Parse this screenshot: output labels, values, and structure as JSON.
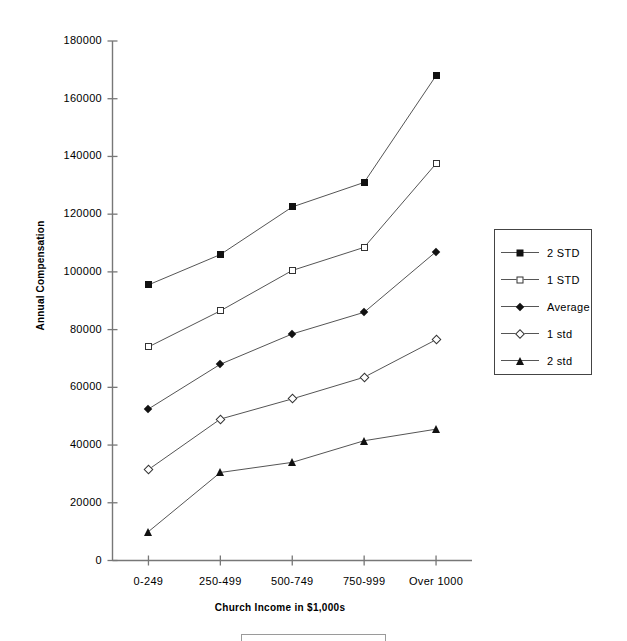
{
  "chart_data": {
    "type": "line",
    "title": "",
    "xlabel": "Church Income in $1,000s",
    "ylabel": "Annual Compensation",
    "categories": [
      "0-249",
      "250-499",
      "500-749",
      "750-999",
      "Over 1000"
    ],
    "ylim": [
      0,
      180000
    ],
    "ytick_labels": [
      "180000",
      "160000",
      "140000",
      "120000",
      "100000",
      "80000",
      "60000",
      "40000",
      "20000",
      "0"
    ],
    "ytick_values": [
      180000,
      160000,
      140000,
      120000,
      100000,
      80000,
      60000,
      40000,
      20000,
      0
    ],
    "ytick_step": 20000,
    "grid": false,
    "legend_position": "right",
    "series": [
      {
        "name": "2 STD",
        "marker": "square-filled",
        "values": [
          95500,
          106000,
          122500,
          131000,
          168000
        ]
      },
      {
        "name": "1 STD",
        "marker": "square-open",
        "values": [
          74000,
          86500,
          100500,
          108500,
          137500
        ]
      },
      {
        "name": "Average",
        "marker": "diamond-filled",
        "values": [
          52500,
          68000,
          78500,
          86000,
          107000
        ]
      },
      {
        "name": "1 std",
        "marker": "diamond-open",
        "values": [
          31500,
          49000,
          56000,
          63500,
          76500
        ]
      },
      {
        "name": "2 std",
        "marker": "triangle-filled",
        "values": [
          10000,
          30500,
          34000,
          41500,
          45500
        ]
      }
    ]
  },
  "colors": {
    "line": "#555555",
    "marker_fill": "#111111",
    "marker_open": "#ffffff",
    "axis": "#777777",
    "text": "#000000",
    "legend_border": "#444444",
    "background": "#ffffff"
  }
}
